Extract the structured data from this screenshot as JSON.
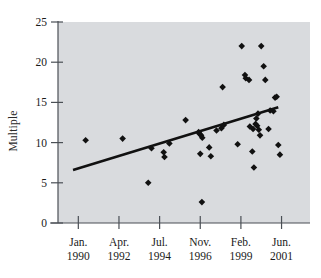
{
  "chart_data": {
    "type": "scatter",
    "title": "",
    "xlabel": "",
    "ylabel": "Multiple",
    "ylim": [
      0,
      25
    ],
    "yticks": [
      0,
      5,
      10,
      15,
      20,
      25
    ],
    "ytick_labels": [
      "0",
      "5",
      "10",
      "15",
      "20",
      "25"
    ],
    "xtick_labels": [
      {
        "month": "Jan.",
        "year": "1990"
      },
      {
        "month": "Apr.",
        "year": "1992"
      },
      {
        "month": "Jul.",
        "year": "1994"
      },
      {
        "month": "Nov.",
        "year": "1996"
      },
      {
        "month": "Feb.",
        "year": "1999"
      },
      {
        "month": "Jun.",
        "year": "2001"
      }
    ],
    "xlim": [
      0,
      6.2
    ],
    "x_axis_note": "x positions expressed as index units where 0.5=Jan.1990 tick, 1.5=Apr.1992, 2.5=Jul.1994, 3.5=Nov.1996, 4.5=Feb.1999, 5.5=Jun.2001",
    "grid": false,
    "legend": false,
    "marker": "diamond",
    "marker_color": "#111111",
    "plot_background_color": "#d9dbde",
    "axis_color": "#4a4f55",
    "trendline": {
      "color": "#111111",
      "width": 2.6,
      "x_start": 0.37,
      "y_start": 6.6,
      "x_end": 5.42,
      "y_end": 14.4
    },
    "points": [
      {
        "x": 0.68,
        "y": 10.3
      },
      {
        "x": 1.59,
        "y": 10.5
      },
      {
        "x": 2.22,
        "y": 5.0
      },
      {
        "x": 2.3,
        "y": 9.3
      },
      {
        "x": 2.6,
        "y": 8.8
      },
      {
        "x": 2.62,
        "y": 8.2
      },
      {
        "x": 2.74,
        "y": 9.9
      },
      {
        "x": 3.14,
        "y": 12.8
      },
      {
        "x": 3.46,
        "y": 11.3
      },
      {
        "x": 3.48,
        "y": 11.1
      },
      {
        "x": 3.52,
        "y": 10.9
      },
      {
        "x": 3.55,
        "y": 10.6
      },
      {
        "x": 3.5,
        "y": 8.6
      },
      {
        "x": 3.72,
        "y": 9.4
      },
      {
        "x": 3.76,
        "y": 8.3
      },
      {
        "x": 3.54,
        "y": 2.6
      },
      {
        "x": 3.9,
        "y": 11.5
      },
      {
        "x": 4.02,
        "y": 11.8
      },
      {
        "x": 4.08,
        "y": 12.2
      },
      {
        "x": 4.05,
        "y": 16.9
      },
      {
        "x": 4.42,
        "y": 9.8
      },
      {
        "x": 4.52,
        "y": 22.0
      },
      {
        "x": 4.6,
        "y": 18.4
      },
      {
        "x": 4.62,
        "y": 18.0
      },
      {
        "x": 4.7,
        "y": 17.8
      },
      {
        "x": 4.72,
        "y": 12.0
      },
      {
        "x": 4.8,
        "y": 11.7
      },
      {
        "x": 4.86,
        "y": 12.3
      },
      {
        "x": 4.9,
        "y": 12.1
      },
      {
        "x": 4.94,
        "y": 11.6
      },
      {
        "x": 4.97,
        "y": 10.9
      },
      {
        "x": 4.88,
        "y": 13.0
      },
      {
        "x": 4.92,
        "y": 13.6
      },
      {
        "x": 5.0,
        "y": 22.0
      },
      {
        "x": 5.06,
        "y": 19.5
      },
      {
        "x": 5.1,
        "y": 17.8
      },
      {
        "x": 4.78,
        "y": 8.9
      },
      {
        "x": 4.82,
        "y": 6.9
      },
      {
        "x": 5.18,
        "y": 11.7
      },
      {
        "x": 5.22,
        "y": 14.0
      },
      {
        "x": 5.3,
        "y": 13.9
      },
      {
        "x": 5.34,
        "y": 15.6
      },
      {
        "x": 5.38,
        "y": 15.7
      },
      {
        "x": 5.42,
        "y": 9.7
      },
      {
        "x": 5.46,
        "y": 8.5
      }
    ]
  }
}
